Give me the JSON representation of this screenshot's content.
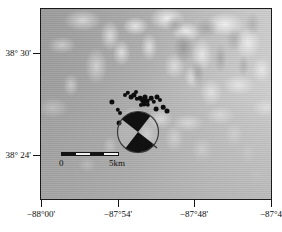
{
  "figure": {
    "type": "map",
    "kind": "shaded-relief-epicenter-map",
    "background_color": "#ffffff",
    "frame_color": "#1a1a1a"
  },
  "axes": {
    "y_ticks": [
      {
        "label": "38° 30'",
        "y_px": 53
      },
      {
        "label": "38° 24'",
        "y_px": 155
      }
    ],
    "x_ticks": [
      {
        "label": "−88°00'",
        "x_px": 41
      },
      {
        "label": "−87°54'",
        "x_px": 118
      },
      {
        "label": "−87°48'",
        "x_px": 194
      },
      {
        "label": "−87°4",
        "x_px": 271
      }
    ]
  },
  "scalebar": {
    "start_label": "0",
    "end_label": "5km",
    "segments": [
      "dark",
      "light",
      "dark",
      "light"
    ]
  },
  "chart_data": {
    "type": "scatter",
    "title": "",
    "xlabel": "",
    "ylabel": "",
    "xlim": [
      "-88°00'",
      "-87°42'"
    ],
    "ylim": [
      "38°21'",
      "38°33'"
    ],
    "grid": false,
    "legend": "none",
    "series": [
      {
        "name": "earthquake epicenters",
        "marker": "filled-circle",
        "color": "#0d0d0d",
        "points": [
          {
            "x_px": 111,
            "y_px": 101,
            "r": 2.6
          },
          {
            "x_px": 117,
            "y_px": 109,
            "r": 2.2
          },
          {
            "x_px": 119,
            "y_px": 112,
            "r": 2.0
          },
          {
            "x_px": 118,
            "y_px": 122,
            "r": 2.4
          },
          {
            "x_px": 130,
            "y_px": 96,
            "r": 2.4
          },
          {
            "x_px": 133,
            "y_px": 94,
            "r": 2.6
          },
          {
            "x_px": 136,
            "y_px": 98,
            "r": 2.2
          },
          {
            "x_px": 139,
            "y_px": 97,
            "r": 2.3
          },
          {
            "x_px": 142,
            "y_px": 99,
            "r": 2.8
          },
          {
            "x_px": 144,
            "y_px": 96,
            "r": 2.5
          },
          {
            "x_px": 146,
            "y_px": 100,
            "r": 2.4
          },
          {
            "x_px": 143,
            "y_px": 103,
            "r": 2.6
          },
          {
            "x_px": 147,
            "y_px": 104,
            "r": 2.2
          },
          {
            "x_px": 140,
            "y_px": 104,
            "r": 2.1
          },
          {
            "x_px": 150,
            "y_px": 97,
            "r": 2.3
          },
          {
            "x_px": 153,
            "y_px": 101,
            "r": 2.2
          },
          {
            "x_px": 156,
            "y_px": 96,
            "r": 2.5
          },
          {
            "x_px": 159,
            "y_px": 99,
            "r": 2.0
          },
          {
            "x_px": 155,
            "y_px": 108,
            "r": 2.4
          },
          {
            "x_px": 162,
            "y_px": 106,
            "r": 2.3
          },
          {
            "x_px": 166,
            "y_px": 110,
            "r": 2.5
          },
          {
            "x_px": 124,
            "y_px": 94,
            "r": 2.0
          },
          {
            "x_px": 127,
            "y_px": 92,
            "r": 2.2
          },
          {
            "x_px": 135,
            "y_px": 91,
            "r": 2.0
          }
        ]
      }
    ],
    "annotations": [
      {
        "name": "focal-mechanism-beachball",
        "x_px": 137,
        "y_px": 131,
        "radius_px": 21,
        "fill_color": "#111111",
        "outline_color": "#3a3a3a",
        "compressional_quadrants": [
          "upper-left",
          "lower-right"
        ]
      }
    ]
  }
}
